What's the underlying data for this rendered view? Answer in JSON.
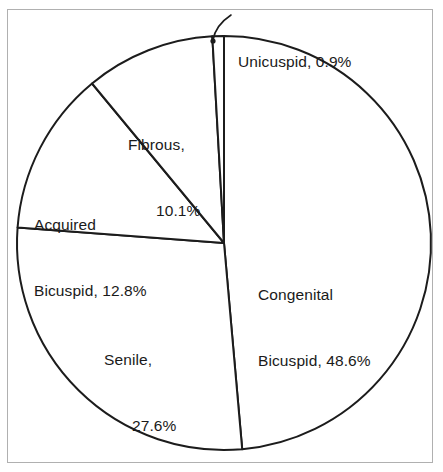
{
  "figure": {
    "background_color": "#ffffff",
    "frame_color": "#b0b0b0",
    "line_color": "#1c1c1c",
    "text_color": "#1a1a1a"
  },
  "chart_data": {
    "type": "pie",
    "title": "",
    "subtitle": "",
    "xlabel": "",
    "ylabel": "",
    "grid": false,
    "legend_position": "none",
    "label_format": "{name}, {value}%",
    "units": "percent",
    "start_angle_deg": -90,
    "direction": "clockwise",
    "categories": [
      "Congenital Bicuspid",
      "Senile",
      "Acquired Bicuspid",
      "Fibrous",
      "Unicuspid"
    ],
    "values": [
      48.6,
      27.6,
      12.8,
      10.1,
      0.9
    ],
    "slices": [
      {
        "name": "Congenital Bicuspid",
        "value": 48.6,
        "label_line1": "Congenital",
        "label_line2": "Bicuspid, 48.6%",
        "fill": "#ffffff",
        "stroke": "#1c1c1c",
        "has_leader": false
      },
      {
        "name": "Senile",
        "value": 27.6,
        "label_line1": "Senile,",
        "label_line2": "27.6%",
        "fill": "#ffffff",
        "stroke": "#1c1c1c",
        "has_leader": false
      },
      {
        "name": "Acquired Bicuspid",
        "value": 12.8,
        "label_line1": "Acquired",
        "label_line2": "Bicuspid, 12.8%",
        "fill": "#ffffff",
        "stroke": "#1c1c1c",
        "has_leader": false
      },
      {
        "name": "Fibrous",
        "value": 10.1,
        "label_line1": "Fibrous,",
        "label_line2": "10.1%",
        "fill": "#ffffff",
        "stroke": "#1c1c1c",
        "has_leader": false
      },
      {
        "name": "Unicuspid",
        "value": 0.9,
        "label_line1": "Unicuspid, 0.9%",
        "label_line2": "",
        "fill": "#ffffff",
        "stroke": "#1c1c1c",
        "has_leader": true
      }
    ]
  }
}
